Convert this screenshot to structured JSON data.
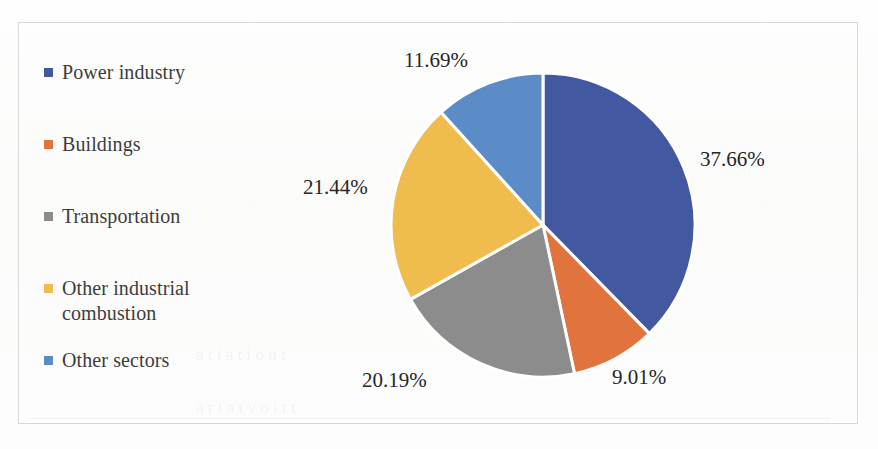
{
  "figure": {
    "background_color": "#fdfdfc",
    "frame_color": "#d8d8d8"
  },
  "legend": {
    "items": [
      {
        "label": "Power industry",
        "color": "#4258a0",
        "marker": "square-marker"
      },
      {
        "label": "Buildings",
        "color": "#e0743c",
        "marker": "square-marker"
      },
      {
        "label": "Transportation",
        "color": "#8c8c8c",
        "marker": "square-marker"
      },
      {
        "label": "Other industrial\ncombustion",
        "color": "#f0bc4e",
        "marker": "square-marker"
      },
      {
        "label": "Other sectors",
        "color": "#5b8cc8",
        "marker": "square-marker"
      }
    ]
  },
  "data_labels": {
    "power_industry": "37.66%",
    "buildings": "9.01%",
    "transportation": "20.19%",
    "other_industrial_combustion": "21.44%",
    "other_sectors": "11.69%"
  },
  "ghost_text": {
    "line1": "c  on il  tnn",
    "line2": "to  t9pn",
    "line3": "a   t i a   t   i o u  t",
    "line4": "a   r i   a t    v o i    t    t"
  },
  "chart_data": {
    "type": "pie",
    "title": "",
    "categories": [
      "Power industry",
      "Buildings",
      "Transportation",
      "Other industrial combustion",
      "Other sectors"
    ],
    "values": [
      37.66,
      9.01,
      20.19,
      21.44,
      11.69
    ],
    "unit": "%",
    "colors": [
      "#4258a0",
      "#e0743c",
      "#8c8c8c",
      "#f0bc4e",
      "#5b8cc8"
    ],
    "labels_shown": [
      "37.66%",
      "9.01%",
      "20.19%",
      "21.44%",
      "11.69%"
    ],
    "total": 99.99,
    "start_angle_deg": 0,
    "direction": "clockwise",
    "legend_position": "left",
    "label_position": "outside",
    "slice_separator_color": "#ffffff",
    "grid": false
  }
}
